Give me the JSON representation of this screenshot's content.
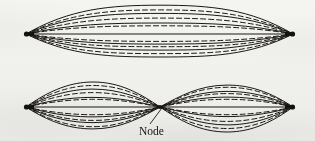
{
  "figure": {
    "background_color": "#f7f7f5",
    "ink_color": "#1a1814",
    "annotations": [
      {
        "id": "node",
        "label": "Node",
        "x": 160,
        "y": 107,
        "label_x": 158,
        "label_y": 133
      }
    ],
    "panels": [
      {
        "id": "fundamental",
        "name": "fundamental-mode",
        "harmonic": 1,
        "antinodes": 1,
        "nodes": 2,
        "axis_y": 34,
        "left_end_x": 26,
        "right_end_x": 293,
        "max_amplitude_up": 24,
        "max_amplitude_down": 23,
        "curve_count": 13,
        "solid_curve_count": 7,
        "dashed_curve_count": 6,
        "amplitude_fractions_solid": [
          1.0,
          0.72,
          0.45,
          0.0,
          -0.42,
          -0.68,
          -1.0
        ],
        "amplitude_fractions_dashed": [
          0.88,
          0.58,
          0.3,
          -0.28,
          -0.55,
          -0.85
        ]
      },
      {
        "id": "second-harmonic",
        "name": "second-harmonic-mode",
        "harmonic": 2,
        "antinodes": 2,
        "nodes": 3,
        "axis_y": 107,
        "left_end_x": 26,
        "right_end_x": 293,
        "node_x": 160,
        "max_amplitude_up": 21,
        "max_amplitude_down": 20,
        "curve_count": 13,
        "solid_curve_count": 7,
        "dashed_curve_count": 6,
        "amplitude_fractions_solid": [
          1.0,
          0.72,
          0.45,
          0.0,
          -0.42,
          -0.68,
          -1.0
        ],
        "amplitude_fractions_dashed": [
          0.88,
          0.58,
          0.3,
          -0.28,
          -0.55,
          -0.85
        ]
      }
    ],
    "endpoint_marker": {
      "name": "fixed-end-dot",
      "shape": "filled-triangle-dot",
      "radius": 3
    },
    "stroke": {
      "solid_width": 1.0,
      "dashed_width": 1.0,
      "dash_pattern": "5,3",
      "axis_width": 1.1
    }
  }
}
